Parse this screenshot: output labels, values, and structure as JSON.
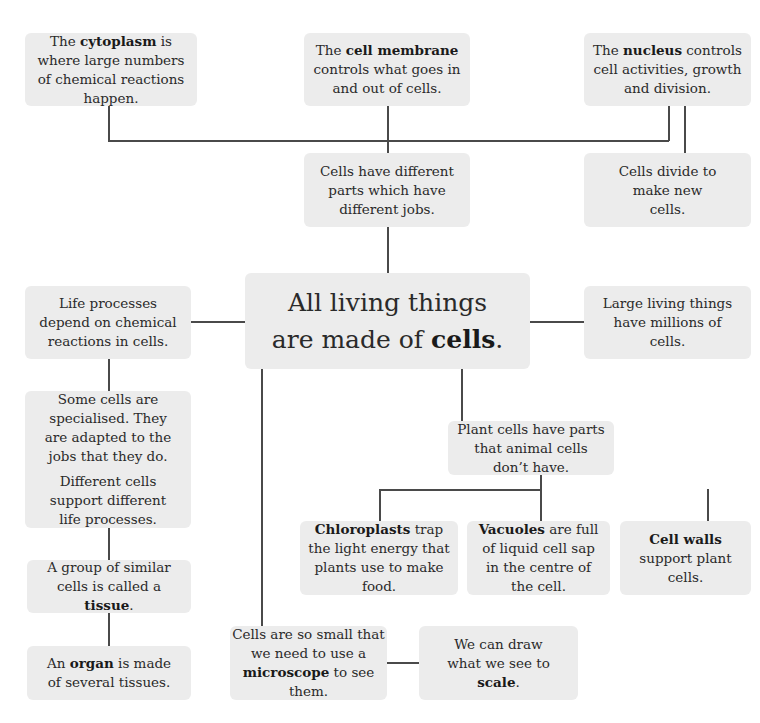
{
  "diagram": {
    "central": {
      "pre": "All living things",
      "pre2": "are made of ",
      "bold": "cells",
      "post": "."
    },
    "nodes": {
      "cytoplasm": {
        "pre": "The ",
        "bold": "cytoplasm",
        "post": " is where large numbers of chemical reactions happen."
      },
      "membrane": {
        "pre": "The ",
        "bold": "cell membrane",
        "post": " controls what goes in and out of cells."
      },
      "nucleus": {
        "pre": "The ",
        "bold": "nucleus",
        "post": " controls cell activities, growth and division."
      },
      "different_parts": {
        "text": "Cells have different parts which have different jobs."
      },
      "divide": {
        "text": "Cells divide to make new cells."
      },
      "life_processes": {
        "text": "Life processes depend on chemical reactions in cells."
      },
      "large_things": {
        "text": "Large living things have millions of cells."
      },
      "specialised": {
        "text": "Some cells are specialised. They are adapted to the jobs that they do.",
        "text2": "Different cells support different life processes."
      },
      "tissue": {
        "pre": "A group of similar cells is called a ",
        "bold": "tissue",
        "post": "."
      },
      "organ": {
        "pre": "An ",
        "bold": "organ",
        "post": " is made of several tissues."
      },
      "plant_cells": {
        "text": "Plant cells have parts that animal cells don’t have."
      },
      "chloroplasts": {
        "pre": "",
        "bold": "Chloroplasts",
        "post": " trap the light energy that plants use to make food."
      },
      "vacuoles": {
        "pre": "",
        "bold": "Vacuoles",
        "post": " are full of liquid cell sap in the centre of the cell."
      },
      "cell_walls": {
        "pre": "",
        "bold": "Cell walls",
        "post": " support plant cells."
      },
      "microscope": {
        "pre": "Cells are so small that we need to use a ",
        "bold": "microscope",
        "post": " to see them."
      },
      "scale": {
        "pre": "We can draw what we see to ",
        "bold": "scale",
        "post": "."
      }
    },
    "colors": {
      "box_fill": "#ececec",
      "line": "#4a4a4a",
      "text": "#2a2a2a"
    }
  }
}
